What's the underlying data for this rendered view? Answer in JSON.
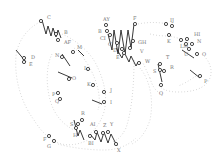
{
  "diagram": {
    "type": "stitch-path-diagram",
    "labels": [
      {
        "text": "C",
        "x": 47,
        "y": 19
      },
      {
        "text": "B",
        "x": 64,
        "y": 34
      },
      {
        "text": "AF",
        "x": 64,
        "y": 44
      },
      {
        "text": "D",
        "x": 31,
        "y": 59
      },
      {
        "text": "E",
        "x": 29,
        "y": 66
      },
      {
        "text": "M",
        "x": 77,
        "y": 49
      },
      {
        "text": "N",
        "x": 55,
        "y": 57
      },
      {
        "text": "L",
        "x": 84,
        "y": 70
      },
      {
        "text": "O",
        "x": 72,
        "y": 80
      },
      {
        "text": "K",
        "x": 87,
        "y": 86
      },
      {
        "text": "J",
        "x": 110,
        "y": 92
      },
      {
        "text": "P",
        "x": 52,
        "y": 96
      },
      {
        "text": "Q",
        "x": 55,
        "y": 103
      },
      {
        "text": "I",
        "x": 110,
        "y": 104
      },
      {
        "text": "R",
        "x": 81,
        "y": 115
      },
      {
        "text": "S",
        "x": 70,
        "y": 126
      },
      {
        "text": "H",
        "x": 73,
        "y": 137
      },
      {
        "text": "AI",
        "x": 90,
        "y": 126
      },
      {
        "text": "Z",
        "x": 103,
        "y": 127
      },
      {
        "text": "Y",
        "x": 110,
        "y": 126
      },
      {
        "text": "BI",
        "x": 88,
        "y": 145
      },
      {
        "text": "X",
        "x": 117,
        "y": 152
      },
      {
        "text": "F",
        "x": 43,
        "y": 141
      },
      {
        "text": "G",
        "x": 47,
        "y": 148
      },
      {
        "text": "AY",
        "x": 103,
        "y": 21
      },
      {
        "text": "B",
        "x": 98,
        "y": 33
      },
      {
        "text": "CI",
        "x": 100,
        "y": 40
      },
      {
        "text": "F",
        "x": 133,
        "y": 20
      },
      {
        "text": "C",
        "x": 108,
        "y": 46
      },
      {
        "text": "D",
        "x": 113,
        "y": 52
      },
      {
        "text": "E",
        "x": 116,
        "y": 59
      },
      {
        "text": "GH",
        "x": 138,
        "y": 44
      },
      {
        "text": "V",
        "x": 140,
        "y": 53
      },
      {
        "text": "W",
        "x": 145,
        "y": 63
      },
      {
        "text": "IJ",
        "x": 170,
        "y": 22
      },
      {
        "text": "K",
        "x": 167,
        "y": 43
      },
      {
        "text": "HI",
        "x": 194,
        "y": 36
      },
      {
        "text": "N",
        "x": 197,
        "y": 43
      },
      {
        "text": "LM",
        "x": 180,
        "y": 48
      },
      {
        "text": "U",
        "x": 184,
        "y": 56
      },
      {
        "text": "O",
        "x": 202,
        "y": 56
      },
      {
        "text": "T",
        "x": 166,
        "y": 59
      },
      {
        "text": "S",
        "x": 153,
        "y": 73
      },
      {
        "text": "R",
        "x": 170,
        "y": 69
      },
      {
        "text": "Q",
        "x": 159,
        "y": 95
      },
      {
        "text": "P",
        "x": 204,
        "y": 83
      }
    ]
  }
}
